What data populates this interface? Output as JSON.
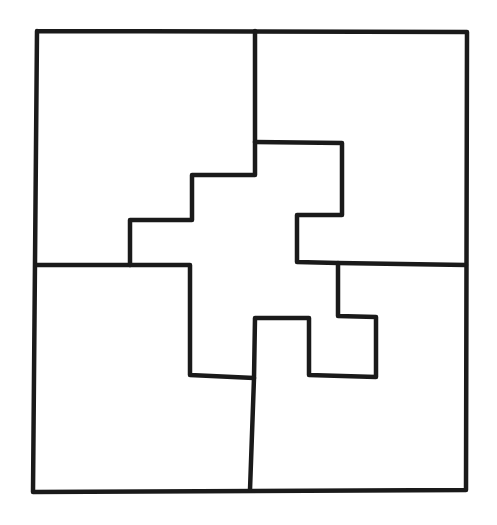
{
  "figure": {
    "piece_count": 4,
    "pieces": [
      {
        "id": "top-left",
        "label": ""
      },
      {
        "id": "top-right",
        "label": ""
      },
      {
        "id": "bottom-left",
        "label": ""
      },
      {
        "id": "bottom-right",
        "label": ""
      }
    ],
    "colors": {
      "stroke": "#1a1a1a",
      "background": "#ffffff"
    }
  }
}
